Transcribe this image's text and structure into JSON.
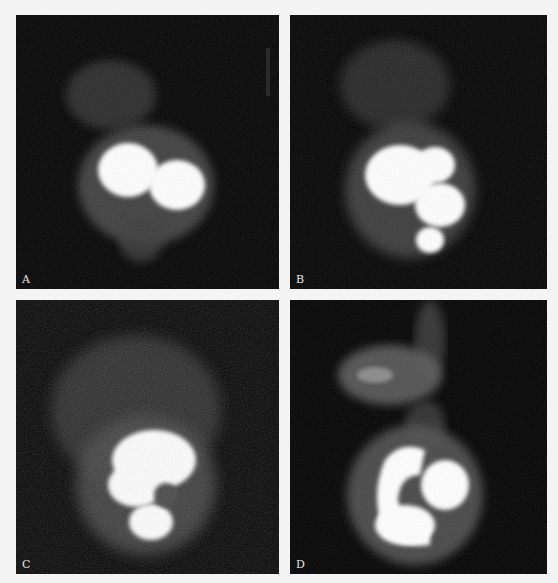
{
  "figure": {
    "background": "#f4f4f4",
    "panel_background": "#020202",
    "panels": [
      {
        "id": "A",
        "label": "A",
        "x": 16,
        "y": 15,
        "w": 263,
        "h": 274
      },
      {
        "id": "B",
        "label": "B",
        "x": 290,
        "y": 15,
        "w": 257,
        "h": 274
      },
      {
        "id": "C",
        "label": "C",
        "x": 16,
        "y": 300,
        "w": 263,
        "h": 274
      },
      {
        "id": "D",
        "label": "D",
        "x": 290,
        "y": 300,
        "w": 257,
        "h": 274
      }
    ]
  }
}
